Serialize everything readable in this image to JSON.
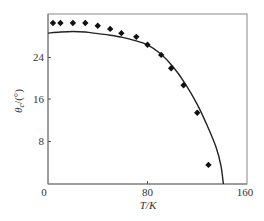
{
  "chart_data": {
    "type": "scatter",
    "title": "",
    "xlabel": "T/K",
    "ylabel": "θc/(°)",
    "xlim": [
      0,
      160
    ],
    "ylim": [
      0,
      32
    ],
    "xticks": [
      0,
      80,
      160
    ],
    "yticks": [
      8,
      16,
      24
    ],
    "grid": false,
    "legend": null,
    "series": [
      {
        "name": "measured",
        "kind": "scatter",
        "marker": "diamond",
        "color": "#111111",
        "x": [
          4,
          10,
          20,
          30,
          40,
          50,
          59,
          71,
          80,
          91,
          99,
          109,
          120,
          129
        ],
        "y": [
          30.3,
          30.3,
          30.3,
          30.3,
          29.8,
          29.2,
          28.4,
          27.7,
          26.2,
          24.3,
          21.8,
          18.6,
          13.4,
          3.6
        ]
      },
      {
        "name": "theory",
        "kind": "line",
        "color": "#222222",
        "x": [
          0,
          10,
          20,
          30,
          40,
          50,
          60,
          70,
          80,
          90,
          100,
          110,
          120,
          128,
          135,
          139,
          141
        ],
        "y": [
          28.4,
          28.6,
          28.7,
          28.6,
          28.3,
          28.0,
          27.6,
          27.0,
          26.2,
          24.6,
          22.2,
          19.0,
          15.0,
          11.0,
          7.0,
          3.5,
          0
        ]
      }
    ]
  },
  "labels": {
    "x_origin": "0",
    "x_mid": "80",
    "x_max": "160",
    "y_8": "8",
    "y_16": "16",
    "y_24": "24",
    "xlabel": "T/K",
    "ylabel_main": "θ",
    "ylabel_sub": "c",
    "ylabel_unit": "/(°)"
  }
}
